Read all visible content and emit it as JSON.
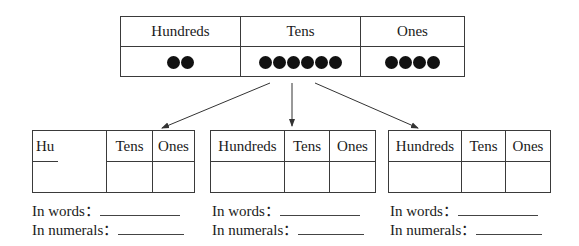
{
  "top_table": {
    "headers": [
      "Hundreds",
      "Tens",
      "Ones"
    ],
    "counts": {
      "hundreds": 2,
      "tens": 6,
      "ones": 4
    },
    "dot_icon": "filled-circle"
  },
  "arrows": {
    "count": 3,
    "direction": "from-top-table-to-each-bottom-table"
  },
  "bottom_tables": [
    {
      "headers": [
        "Hundreds",
        "Tens",
        "Ones"
      ],
      "visible_header_text": [
        "Hu...",
        "Tens",
        "Ones"
      ],
      "values": [
        "",
        "",
        ""
      ],
      "words_label": "In words：",
      "words_value": "",
      "numerals_label": "In numerals：",
      "numerals_value": ""
    },
    {
      "headers": [
        "Hundreds",
        "Tens",
        "Ones"
      ],
      "values": [
        "",
        "",
        ""
      ],
      "words_label": "In words：",
      "words_value": "",
      "numerals_label": "In numerals：",
      "numerals_value": ""
    },
    {
      "headers": [
        "Hundreds",
        "Tens",
        "Ones"
      ],
      "values": [
        "",
        "",
        ""
      ],
      "words_label": "In words：",
      "words_value": "",
      "numerals_label": "In numerals：",
      "numerals_value": ""
    }
  ]
}
